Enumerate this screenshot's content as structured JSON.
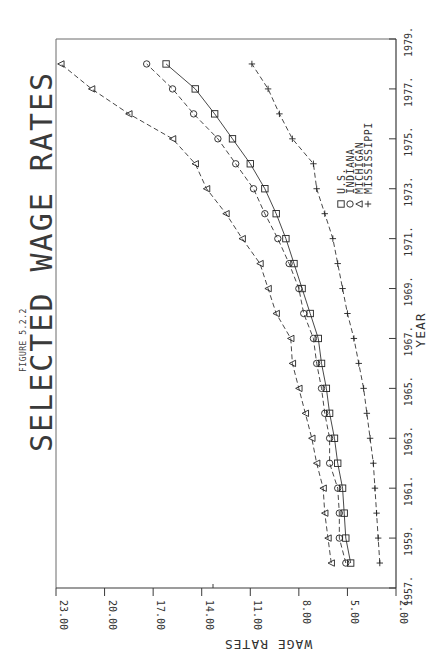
{
  "chart_data": {
    "type": "line",
    "title": "SELECTED WAGE RATES",
    "subtitle": "FIGURE 5.2.2",
    "xlabel": "YEAR",
    "ylabel": "WAGE RATES",
    "orientation": "rotated-90-ccw",
    "xlim": [
      1957,
      1979
    ],
    "ylim": [
      2.0,
      23.0
    ],
    "x_ticks": [
      "1957.",
      "1959.",
      "1961.",
      "1963.",
      "1965.",
      "1967.",
      "1969.",
      "1971.",
      "1973.",
      "1975.",
      "1977.",
      "1979."
    ],
    "y_ticks": [
      "2.00",
      "5.00",
      "8.00",
      "11.00",
      "14.00",
      "17.00",
      "20.00",
      "23.00"
    ],
    "grid": false,
    "legend_position": "lower-right (inside plot, rotated)",
    "x": [
      1958,
      1959,
      1960,
      1961,
      1962,
      1963,
      1964,
      1965,
      1966,
      1967,
      1968,
      1969,
      1970,
      1971,
      1972,
      1973,
      1974,
      1975,
      1976,
      1977,
      1978
    ],
    "series": [
      {
        "name": "U.S.",
        "marker": "square",
        "line": "solid",
        "values": [
          4.8,
          5.1,
          5.2,
          5.3,
          5.6,
          5.8,
          6.1,
          6.3,
          6.6,
          6.8,
          7.3,
          7.8,
          8.3,
          8.8,
          9.4,
          10.1,
          11.0,
          12.1,
          13.2,
          14.4,
          16.2
        ]
      },
      {
        "name": "INDIANA",
        "marker": "circle",
        "line": "dashed",
        "values": [
          5.1,
          5.5,
          5.5,
          5.6,
          6.1,
          6.1,
          6.4,
          6.6,
          6.9,
          7.1,
          7.7,
          8.0,
          8.6,
          9.3,
          10.1,
          10.8,
          11.9,
          13.0,
          14.5,
          15.8,
          17.4
        ]
      },
      {
        "name": "MICHIGAN",
        "marker": "triangle",
        "line": "dashed",
        "values": [
          6.0,
          6.2,
          6.4,
          6.5,
          6.9,
          7.2,
          7.6,
          8.0,
          8.4,
          8.5,
          9.4,
          9.9,
          10.4,
          11.5,
          12.5,
          13.7,
          14.4,
          15.8,
          18.5,
          20.8,
          22.7
        ]
      },
      {
        "name": "MISSISSIPPI",
        "marker": "plus",
        "line": "dashed",
        "values": [
          3.0,
          3.1,
          3.2,
          3.3,
          3.4,
          3.6,
          3.8,
          4.0,
          4.3,
          4.6,
          5.0,
          5.3,
          5.6,
          5.9,
          6.4,
          6.9,
          7.1,
          8.4,
          9.2,
          9.9,
          10.9
        ]
      }
    ]
  }
}
